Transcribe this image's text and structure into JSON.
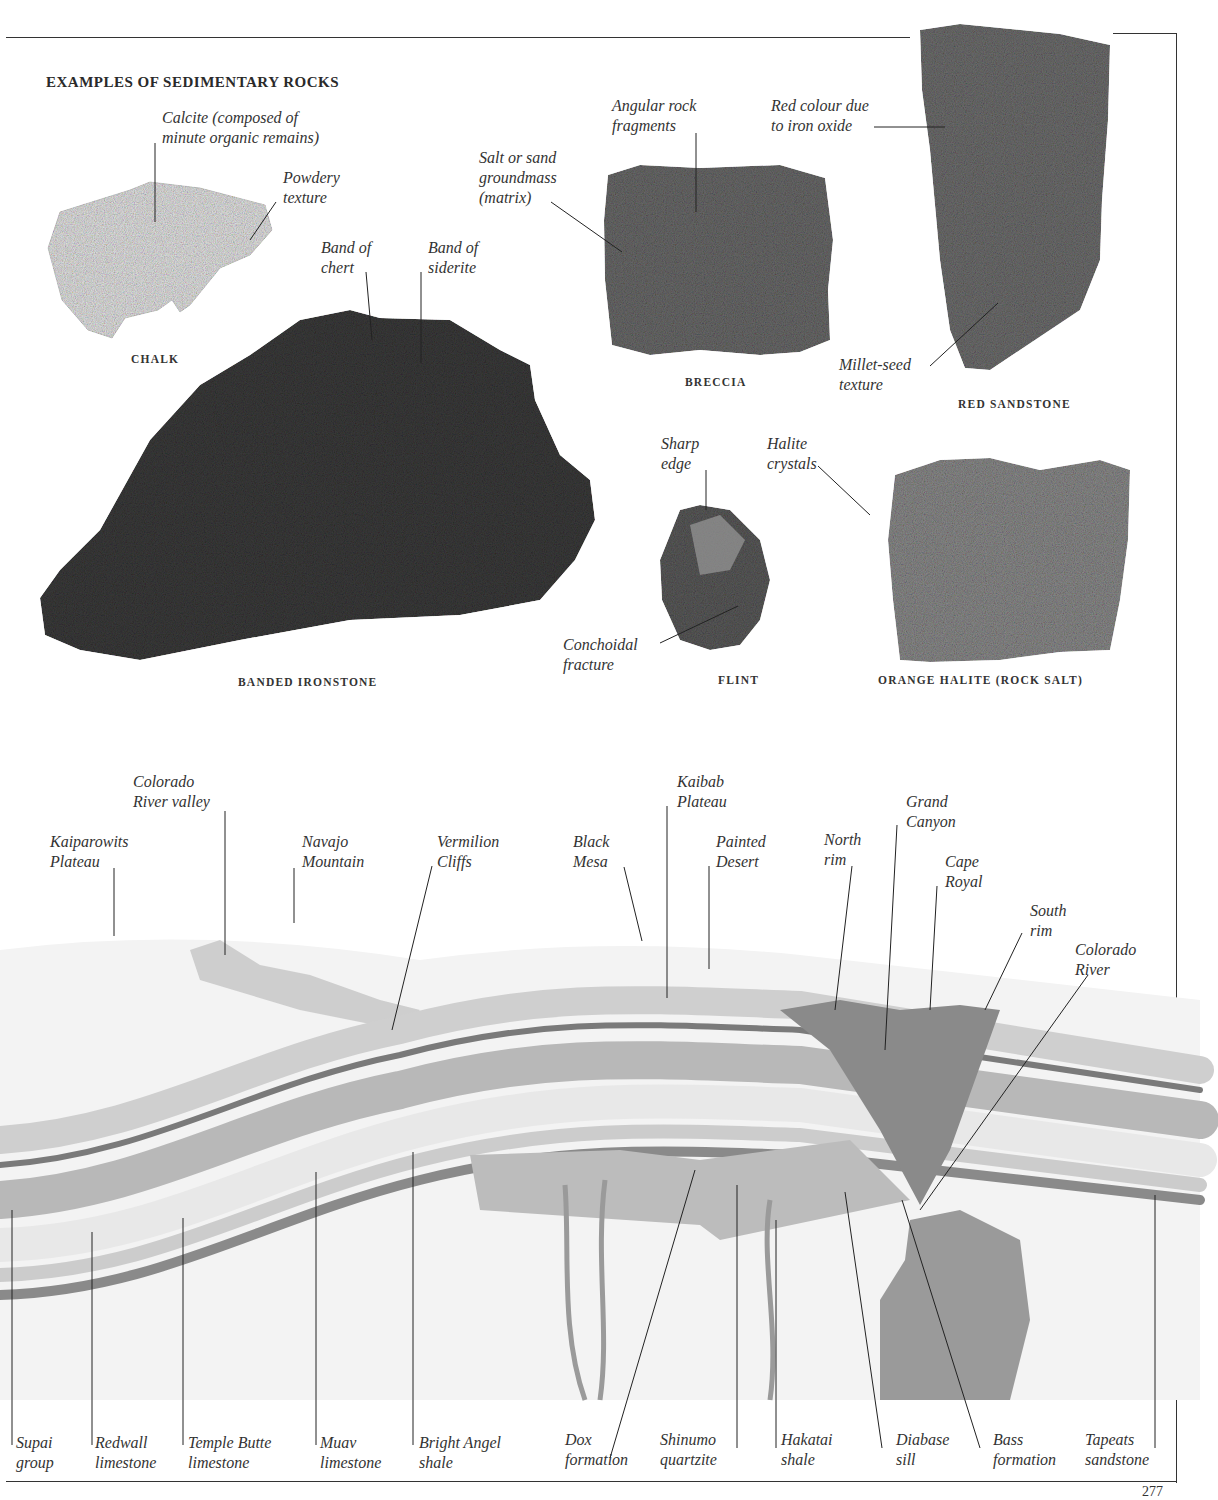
{
  "page": {
    "section_title": "EXAMPLES OF SEDIMENTARY ROCKS",
    "page_number": "277"
  },
  "rocks": [
    {
      "id": "chalk",
      "caption": "CHALK",
      "labels": [
        "Calcite (composed of\nminute organic remains)",
        "Powdery\ntexture"
      ],
      "color": "#e6e6e6"
    },
    {
      "id": "banded-ironstone",
      "caption": "BANDED IRONSTONE",
      "labels": [
        "Band of\nchert",
        "Band of\nsiderite"
      ],
      "color": "#3a3a3a"
    },
    {
      "id": "breccia",
      "caption": "BRECCIA",
      "labels": [
        "Angular rock\nfragments",
        "Salt or sand\ngroundmass\n(matrix)"
      ],
      "color": "#6a6a6a"
    },
    {
      "id": "red-sandstone",
      "caption": "RED SANDSTONE",
      "labels": [
        "Red colour due\nto iron oxide",
        "Millet-seed\ntexture"
      ],
      "color": "#6f6f6f"
    },
    {
      "id": "flint",
      "caption": "FLINT",
      "labels": [
        "Sharp\nedge",
        "Conchoidal\nfracture"
      ],
      "color": "#5a5a5a"
    },
    {
      "id": "orange-halite",
      "caption": "ORANGE HALITE (ROCK SALT)",
      "labels": [
        "Halite\ncrystals"
      ],
      "color": "#8a8a8a"
    }
  ],
  "cross_section": {
    "surface_labels": [
      "Kaiparowits\nPlateau",
      "Colorado\nRiver valley",
      "Navajo\nMountain",
      "Vermilion\nCliffs",
      "Black\nMesa",
      "Kaibab\nPlateau",
      "Painted\nDesert",
      "North\nrim",
      "Grand\nCanyon",
      "Cape\nRoyal",
      "South\nrim",
      "Colorado\nRiver"
    ],
    "strata_labels": [
      "Supai\ngroup",
      "Redwall\nlimestone",
      "Temple Butte\nlimestone",
      "Muav\nlimestone",
      "Bright Angel\nshale",
      "Dox\nformation",
      "Shinumo\nquartzite",
      "Hakatai\nshale",
      "Diabase\nsill",
      "Bass\nformation",
      "Tapeats\nsandstone"
    ]
  }
}
